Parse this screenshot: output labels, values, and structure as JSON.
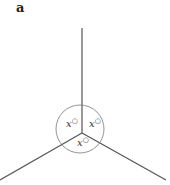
{
  "panel_label": "a",
  "diagram": {
    "center": [
      82,
      133
    ],
    "circle_radius": 24,
    "angles": [
      {
        "label": "x°",
        "position": "left"
      },
      {
        "label": "x°",
        "position": "right"
      },
      {
        "label": "x°",
        "position": "bottom"
      }
    ],
    "line_color": "#555555",
    "circle_color": "#777777"
  }
}
